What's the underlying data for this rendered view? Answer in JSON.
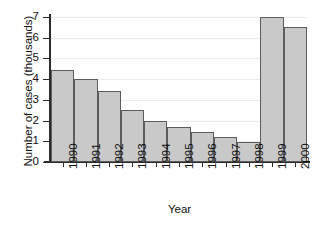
{
  "chart_data": {
    "type": "bar",
    "title": "",
    "xlabel": "Year",
    "ylabel": "Number of cases (thousands)",
    "categories": [
      "1990",
      "1991",
      "1992",
      "1993",
      "1994",
      "1995",
      "1996",
      "1997",
      "1998",
      "1999",
      "2000"
    ],
    "values": [
      4.45,
      4.0,
      3.45,
      2.5,
      2.0,
      1.7,
      1.45,
      1.2,
      0.95,
      7.0,
      6.5
    ],
    "ylim": [
      0,
      7
    ],
    "yticks": [
      0,
      1,
      2,
      3,
      4,
      5,
      6,
      7
    ],
    "ytick_labels": [
      "0",
      "1",
      "2",
      "3",
      "4",
      "5",
      "6",
      "7"
    ],
    "grid": true,
    "legend": false,
    "bar_fill_color": "#c9c9c9",
    "bar_edge_color": "#5d5d5d",
    "axis_color": "#2b2b2b",
    "gridline_color": "#ececec"
  }
}
